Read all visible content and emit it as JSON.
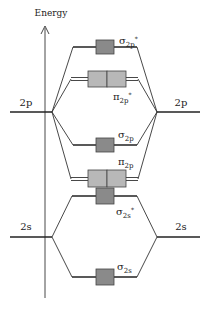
{
  "diagram": {
    "type": "molecular-orbital-energy-diagram",
    "axis": {
      "label": "Energy"
    },
    "atomic_orbitals": {
      "left": [
        {
          "label": "2p",
          "y": 112
        },
        {
          "label": "2s",
          "y": 237
        }
      ],
      "right": [
        {
          "label": "2p",
          "y": 112
        },
        {
          "label": "2s",
          "y": 237
        }
      ]
    },
    "molecular_orbitals": [
      {
        "id": "sigma2p_star",
        "symbol": "σ",
        "sub": "2p",
        "sup": "*",
        "degenerate": 1,
        "y": 47
      },
      {
        "id": "pi2p_star",
        "symbol": "π",
        "sub": "2p",
        "sup": "*",
        "degenerate": 2,
        "y": 79
      },
      {
        "id": "sigma2p",
        "symbol": "σ",
        "sub": "2p",
        "sup": "",
        "degenerate": 1,
        "y": 145
      },
      {
        "id": "pi2p",
        "symbol": "π",
        "sub": "2p",
        "sup": "",
        "degenerate": 2,
        "y": 179
      },
      {
        "id": "sigma2s_star",
        "symbol": "σ",
        "sub": "2s",
        "sup": "*",
        "degenerate": 1,
        "y": 196
      },
      {
        "id": "sigma2s",
        "symbol": "σ",
        "sub": "2s",
        "sup": "",
        "degenerate": 1,
        "y": 277
      }
    ],
    "colors": {
      "sigma_box": "#8a8a8a",
      "pi_box": "#b8b8b8",
      "line": "#222222"
    }
  }
}
